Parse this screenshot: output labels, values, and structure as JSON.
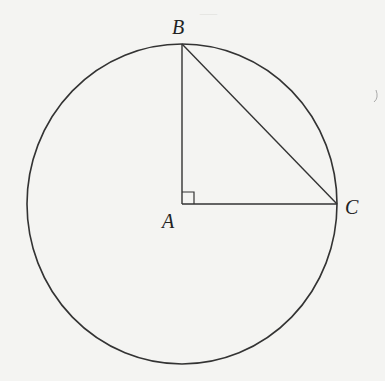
{
  "figure": {
    "points": {
      "A": {
        "label": "A",
        "x": 182,
        "y": 204
      },
      "B": {
        "label": "B",
        "x": 182,
        "y": 44
      },
      "C": {
        "label": "C",
        "x": 337,
        "y": 204
      }
    },
    "circle": {
      "cx": 182,
      "cy": 204,
      "rx": 155,
      "ry": 160
    },
    "right_angle_at": "A",
    "stroke_color": "#333333",
    "background_color": "#f4f4f2"
  }
}
